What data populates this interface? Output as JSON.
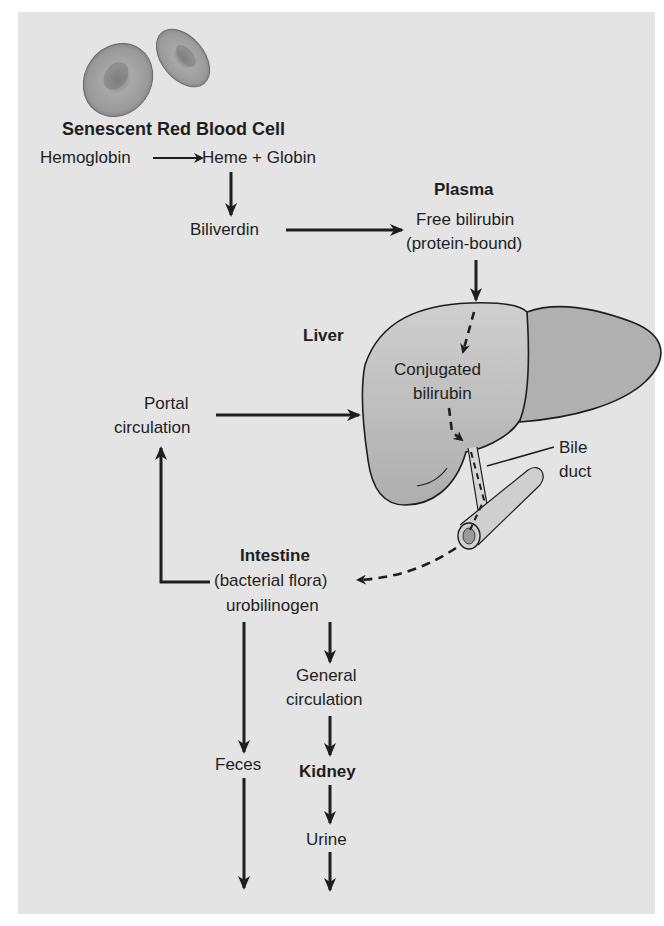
{
  "figure": {
    "title": "Senescent Red Blood Cell",
    "nodes": {
      "hemoglobin": "Hemoglobin",
      "heme_globin": "Heme + Globin",
      "biliverdin": "Biliverdin",
      "plasma_title": "Plasma",
      "plasma_line1": "Free bilirubin",
      "plasma_line2": "(protein-bound)",
      "liver_title": "Liver",
      "conjugated_line1": "Conjugated",
      "conjugated_line2": "bilirubin",
      "bile_line1": "Bile",
      "bile_line2": "duct",
      "portal_line1": "Portal",
      "portal_line2": "circulation",
      "intestine_title": "Intestine",
      "intestine_line1": "(bacterial flora)",
      "intestine_line2": "urobilinogen",
      "general_line1": "General",
      "general_line2": "circulation",
      "feces": "Feces",
      "kidney_title": "Kidney",
      "urine": "Urine"
    },
    "colors": {
      "background": "#e4e4e4",
      "ink": "#1e1e1e",
      "organ_fill": "#b9b9b9",
      "cell_fill": "#9a9a9a"
    }
  }
}
